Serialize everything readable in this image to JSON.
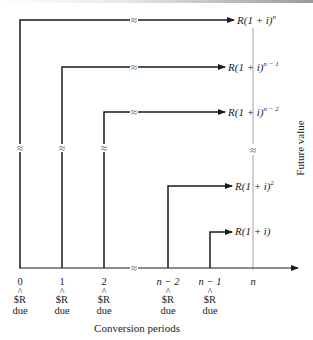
{
  "figure": {
    "x_axis_title": "Conversion periods",
    "y_axis_title": "Future value",
    "ticks": [
      {
        "value": "0",
        "caret": "^",
        "payment": "$R",
        "status": "due"
      },
      {
        "value": "1",
        "caret": "^",
        "payment": "$R",
        "status": "due"
      },
      {
        "value": "2",
        "caret": "^",
        "payment": "$R",
        "status": "due"
      },
      {
        "value": "n − 2",
        "caret": "^",
        "payment": "$R",
        "status": "due"
      },
      {
        "value": "n − 1",
        "caret": "^",
        "payment": "$R",
        "status": "due"
      },
      {
        "value": "n",
        "caret": "",
        "payment": "",
        "status": ""
      }
    ],
    "future_values": [
      {
        "base": "R(1 + i)",
        "exponent": "n"
      },
      {
        "base": "R(1 + i)",
        "exponent": "n − 1"
      },
      {
        "base": "R(1 + i)",
        "exponent": "n − 2"
      },
      {
        "base": "R(1 + i)",
        "exponent": "2"
      },
      {
        "base": "R(1 + i)",
        "exponent": ""
      }
    ],
    "break_symbol": "≈",
    "colors": {
      "line": "#1a1a1a",
      "thin_line": "#8a8a8a",
      "text": "#222222"
    }
  }
}
